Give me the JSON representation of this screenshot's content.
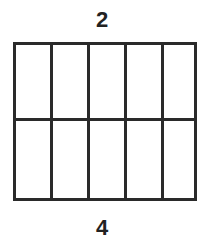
{
  "diagram": {
    "top_label": "2",
    "bottom_label": "4",
    "grid": {
      "rows": 2,
      "columns": 5
    },
    "line_color": "#2a2a2a"
  }
}
